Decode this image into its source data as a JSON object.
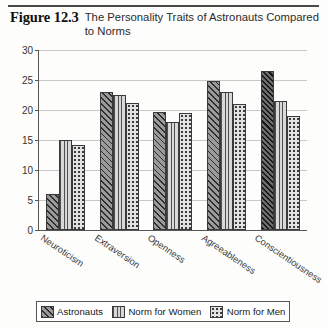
{
  "figure": {
    "number_label": "Figure 12.3",
    "title": "The Personality Traits of Astronauts Compared to Norms"
  },
  "legend": {
    "position": "bottom",
    "entries": [
      {
        "label": "Astronauts",
        "pattern": "diagonal-hatch-icon"
      },
      {
        "label": "Norm for Women",
        "pattern": "vertical-lines-icon"
      },
      {
        "label": "Norm for Men",
        "pattern": "dots-icon"
      }
    ]
  },
  "chart_data": {
    "type": "bar",
    "title": "The Personality Traits of Astronauts Compared to Norms",
    "xlabel": "",
    "ylabel": "",
    "ylim": [
      0,
      30
    ],
    "ytick_step": 5,
    "yticks": [
      "0",
      "5",
      "10",
      "15",
      "20",
      "25",
      "30"
    ],
    "grid": true,
    "legend_position": "bottom",
    "categories": [
      "Neuroticism",
      "Extraversion",
      "Openness",
      "Agreeableness",
      "Conscientiousness"
    ],
    "series": [
      {
        "name": "Astronauts",
        "values": [
          6.0,
          23.0,
          19.7,
          24.8,
          26.5
        ]
      },
      {
        "name": "Norm for Women",
        "values": [
          15.0,
          22.5,
          18.0,
          23.0,
          21.5
        ]
      },
      {
        "name": "Norm for Men",
        "values": [
          14.2,
          21.2,
          19.5,
          21.0,
          19.0
        ]
      }
    ]
  }
}
